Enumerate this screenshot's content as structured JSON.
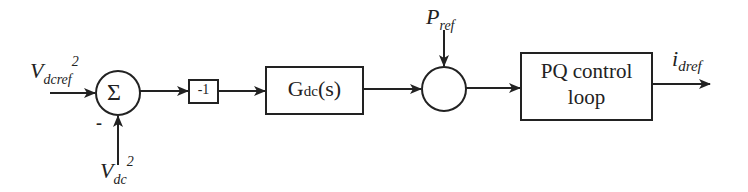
{
  "diagram": {
    "type": "control block diagram",
    "stroke_color": "#222222",
    "inputs": {
      "vdcref": {
        "main": "V",
        "sub": "dcref",
        "sup": "2"
      },
      "vdc": {
        "main": "V",
        "sub": "dc",
        "sup": "2",
        "sign": "-"
      },
      "pref": {
        "main": "P",
        "sub": "ref"
      }
    },
    "blocks": {
      "sum": {
        "symbol": "Σ"
      },
      "gain": {
        "label": "-1"
      },
      "gdc": {
        "main": "G",
        "sub": "dc",
        "tail": "(s)"
      },
      "pq": {
        "line1": "PQ control",
        "line2": "loop"
      }
    },
    "output": {
      "main": "i",
      "sub": "dref"
    }
  }
}
